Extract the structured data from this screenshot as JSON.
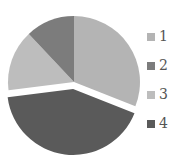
{
  "chart_data": {
    "type": "pie",
    "title": "",
    "categories": [
      "1",
      "2",
      "3",
      "4"
    ],
    "values": [
      31,
      12,
      15,
      42
    ],
    "colors": [
      "#b4b4b4",
      "#7c7c7c",
      "#bdbdbd",
      "#5a5a5a"
    ],
    "exploded": [
      false,
      false,
      false,
      true
    ],
    "legend_position": "right",
    "start_angle_deg": 0,
    "direction": "clockwise",
    "draw_order": [
      0,
      3,
      2,
      1
    ]
  },
  "legend": {
    "items": [
      {
        "label": "1",
        "color": "#b4b4b4"
      },
      {
        "label": "2",
        "color": "#7c7c7c"
      },
      {
        "label": "3",
        "color": "#bdbdbd"
      },
      {
        "label": "4",
        "color": "#5a5a5a"
      }
    ]
  }
}
